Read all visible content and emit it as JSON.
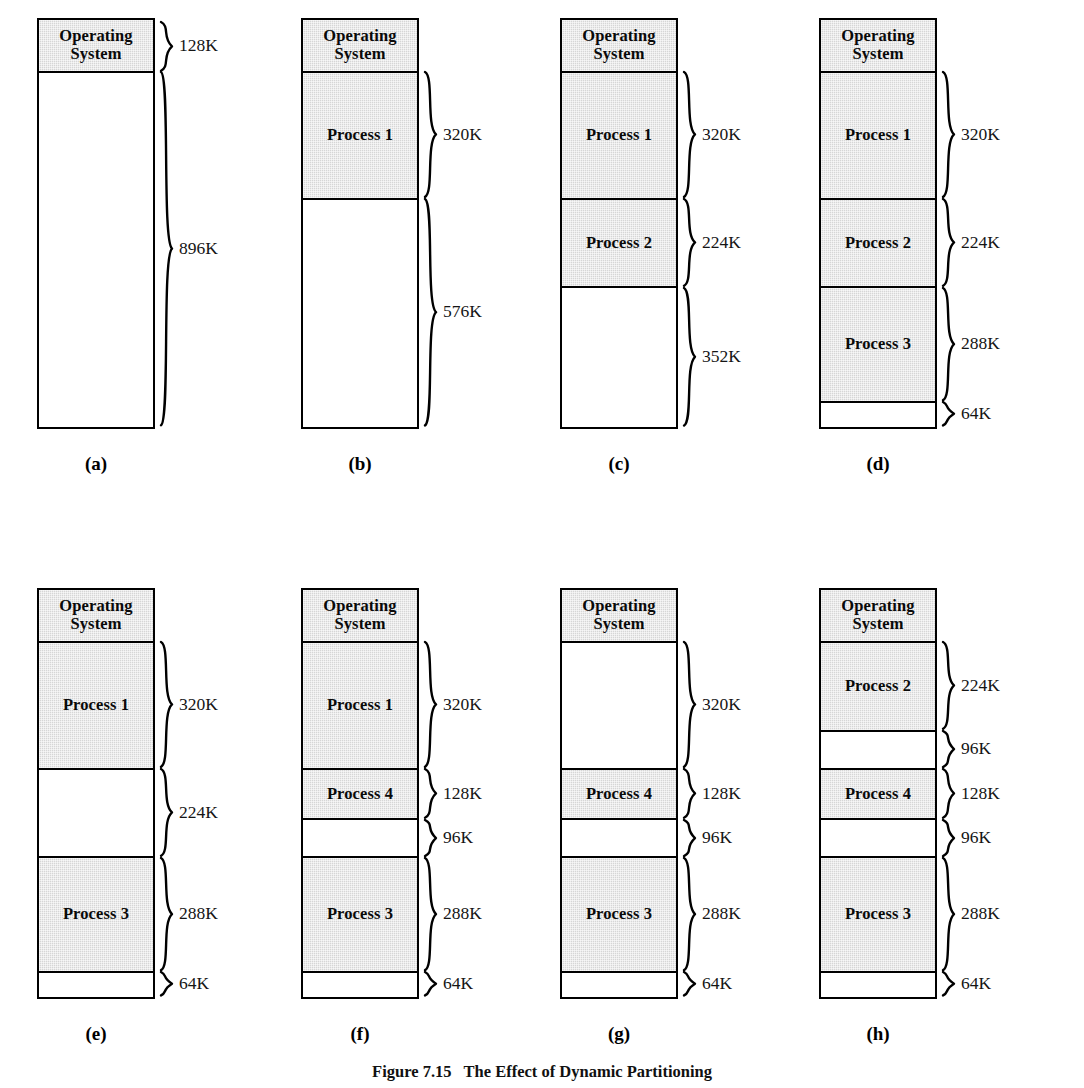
{
  "figure": {
    "caption_number": "Figure 7.15",
    "caption_text": "The Effect of Dynamic Partitioning",
    "total_memory": "1024K",
    "scale_px_per_k": 0.3965,
    "fill_shaded": "#d6d6d6",
    "fill_free": "#ffffff",
    "stroke": "#000000"
  },
  "panels": [
    {
      "letter": "(a)",
      "left": 0,
      "top": 18,
      "blocks": [
        {
          "label": "Operating\nSystem",
          "size": "128K",
          "kb": 128,
          "shaded": true,
          "brace": true
        },
        {
          "label": "",
          "size": "896K",
          "kb": 896,
          "shaded": false,
          "brace": true
        }
      ]
    },
    {
      "letter": "(b)",
      "left": 264,
      "top": 18,
      "blocks": [
        {
          "label": "Operating\nSystem",
          "size": "",
          "kb": 128,
          "shaded": true,
          "brace": false
        },
        {
          "label": "Process 1",
          "size": "320K",
          "kb": 320,
          "shaded": true,
          "brace": true
        },
        {
          "label": "",
          "size": "576K",
          "kb": 576,
          "shaded": false,
          "brace": true
        }
      ]
    },
    {
      "letter": "(c)",
      "left": 523,
      "top": 18,
      "blocks": [
        {
          "label": "Operating\nSystem",
          "size": "",
          "kb": 128,
          "shaded": true,
          "brace": false
        },
        {
          "label": "Process 1",
          "size": "320K",
          "kb": 320,
          "shaded": true,
          "brace": true
        },
        {
          "label": "Process 2",
          "size": "224K",
          "kb": 224,
          "shaded": true,
          "brace": true
        },
        {
          "label": "",
          "size": "352K",
          "kb": 352,
          "shaded": false,
          "brace": true
        }
      ]
    },
    {
      "letter": "(d)",
      "left": 782,
      "top": 18,
      "blocks": [
        {
          "label": "Operating\nSystem",
          "size": "",
          "kb": 128,
          "shaded": true,
          "brace": false
        },
        {
          "label": "Process 1",
          "size": "320K",
          "kb": 320,
          "shaded": true,
          "brace": true
        },
        {
          "label": "Process 2",
          "size": "224K",
          "kb": 224,
          "shaded": true,
          "brace": true
        },
        {
          "label": "Process 3",
          "size": "288K",
          "kb": 288,
          "shaded": true,
          "brace": true
        },
        {
          "label": "",
          "size": "64K",
          "kb": 64,
          "shaded": false,
          "brace": true
        }
      ]
    },
    {
      "letter": "(e)",
      "left": 0,
      "top": 588,
      "blocks": [
        {
          "label": "Operating\nSystem",
          "size": "",
          "kb": 128,
          "shaded": true,
          "brace": false
        },
        {
          "label": "Process 1",
          "size": "320K",
          "kb": 320,
          "shaded": true,
          "brace": true
        },
        {
          "label": "",
          "size": "224K",
          "kb": 224,
          "shaded": false,
          "brace": true
        },
        {
          "label": "Process 3",
          "size": "288K",
          "kb": 288,
          "shaded": true,
          "brace": true
        },
        {
          "label": "",
          "size": "64K",
          "kb": 64,
          "shaded": false,
          "brace": true
        }
      ]
    },
    {
      "letter": "(f)",
      "left": 264,
      "top": 588,
      "blocks": [
        {
          "label": "Operating\nSystem",
          "size": "",
          "kb": 128,
          "shaded": true,
          "brace": false
        },
        {
          "label": "Process 1",
          "size": "320K",
          "kb": 320,
          "shaded": true,
          "brace": true
        },
        {
          "label": "Process 4",
          "size": "128K",
          "kb": 128,
          "shaded": true,
          "brace": true
        },
        {
          "label": "",
          "size": "96K",
          "kb": 96,
          "shaded": false,
          "brace": true
        },
        {
          "label": "Process 3",
          "size": "288K",
          "kb": 288,
          "shaded": true,
          "brace": true
        },
        {
          "label": "",
          "size": "64K",
          "kb": 64,
          "shaded": false,
          "brace": true
        }
      ]
    },
    {
      "letter": "(g)",
      "left": 523,
      "top": 588,
      "blocks": [
        {
          "label": "Operating\nSystem",
          "size": "",
          "kb": 128,
          "shaded": true,
          "brace": false
        },
        {
          "label": "",
          "size": "320K",
          "kb": 320,
          "shaded": false,
          "brace": true
        },
        {
          "label": "Process 4",
          "size": "128K",
          "kb": 128,
          "shaded": true,
          "brace": true
        },
        {
          "label": "",
          "size": "96K",
          "kb": 96,
          "shaded": false,
          "brace": true
        },
        {
          "label": "Process 3",
          "size": "288K",
          "kb": 288,
          "shaded": true,
          "brace": true
        },
        {
          "label": "",
          "size": "64K",
          "kb": 64,
          "shaded": false,
          "brace": true
        }
      ]
    },
    {
      "letter": "(h)",
      "left": 782,
      "top": 588,
      "blocks": [
        {
          "label": "Operating\nSystem",
          "size": "",
          "kb": 128,
          "shaded": true,
          "brace": false
        },
        {
          "label": "Process 2",
          "size": "224K",
          "kb": 224,
          "shaded": true,
          "brace": true
        },
        {
          "label": "",
          "size": "96K",
          "kb": 96,
          "shaded": false,
          "brace": true
        },
        {
          "label": "Process 4",
          "size": "128K",
          "kb": 128,
          "shaded": true,
          "brace": true
        },
        {
          "label": "",
          "size": "96K",
          "kb": 96,
          "shaded": false,
          "brace": true
        },
        {
          "label": "Process 3",
          "size": "288K",
          "kb": 288,
          "shaded": true,
          "brace": true
        },
        {
          "label": "",
          "size": "64K",
          "kb": 64,
          "shaded": false,
          "brace": true
        }
      ]
    }
  ]
}
